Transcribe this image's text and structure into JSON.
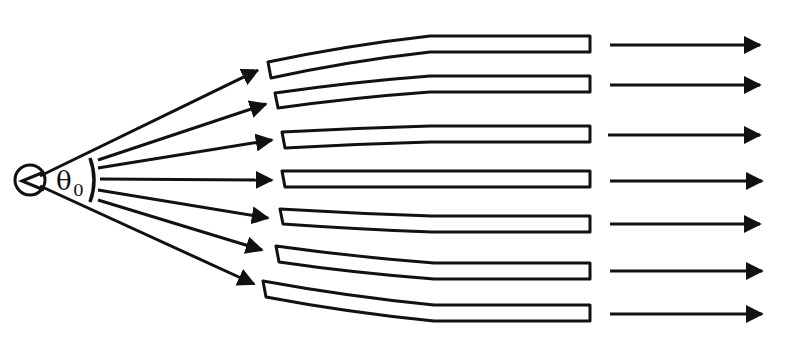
{
  "figure": {
    "type": "diagram",
    "source": {
      "label": "point-source",
      "cx": 30,
      "cy": 180,
      "r": 15
    },
    "angle_label": {
      "symbol": "θ",
      "subscript": "0",
      "text": "θ0"
    },
    "ink_color": "#111111",
    "background_color": "#ffffff",
    "fan_arrows": [
      {
        "x1": 40,
        "y1": 176,
        "x2": 258,
        "y2": 70
      },
      {
        "x1": 98,
        "y1": 160,
        "x2": 266,
        "y2": 104
      },
      {
        "x1": 98,
        "y1": 168,
        "x2": 272,
        "y2": 140
      },
      {
        "x1": 100,
        "y1": 179,
        "x2": 272,
        "y2": 180
      },
      {
        "x1": 98,
        "y1": 190,
        "x2": 268,
        "y2": 218
      },
      {
        "x1": 98,
        "y1": 200,
        "x2": 262,
        "y2": 250
      },
      {
        "x1": 40,
        "y1": 186,
        "x2": 254,
        "y2": 284
      }
    ],
    "tubes": [
      {
        "inlet_x": 268,
        "inlet_y_top": 62,
        "inlet_y_bot": 78,
        "bend_x": 430,
        "out_y_top": 36,
        "out_y_bot": 52,
        "out_x": 590
      },
      {
        "inlet_x": 275,
        "inlet_y_top": 93,
        "inlet_y_bot": 108,
        "bend_x": 430,
        "out_y_top": 76,
        "out_y_bot": 92,
        "out_x": 590
      },
      {
        "inlet_x": 282,
        "inlet_y_top": 132,
        "inlet_y_bot": 148,
        "bend_x": 430,
        "out_y_top": 126,
        "out_y_bot": 142,
        "out_x": 590
      },
      {
        "inlet_x": 282,
        "inlet_y_top": 171,
        "inlet_y_bot": 187,
        "bend_x": 430,
        "out_y_top": 171,
        "out_y_bot": 187,
        "out_x": 590
      },
      {
        "inlet_x": 280,
        "inlet_y_top": 209,
        "inlet_y_bot": 224,
        "bend_x": 432,
        "out_y_top": 216,
        "out_y_bot": 232,
        "out_x": 590
      },
      {
        "inlet_x": 276,
        "inlet_y_top": 246,
        "inlet_y_bot": 262,
        "bend_x": 434,
        "out_y_top": 263,
        "out_y_bot": 279,
        "out_x": 590
      },
      {
        "inlet_x": 263,
        "inlet_y_top": 281,
        "inlet_y_bot": 297,
        "bend_x": 434,
        "out_y_top": 305,
        "out_y_bot": 321,
        "out_x": 590
      }
    ],
    "output_arrows": [
      {
        "y": 45,
        "x1": 610,
        "x2": 760
      },
      {
        "y": 85,
        "x1": 610,
        "x2": 760
      },
      {
        "y": 135,
        "x1": 608,
        "x2": 760
      },
      {
        "y": 181,
        "x1": 610,
        "x2": 762
      },
      {
        "y": 224,
        "x1": 610,
        "x2": 760
      },
      {
        "y": 271,
        "x1": 610,
        "x2": 762
      },
      {
        "y": 314,
        "x1": 610,
        "x2": 762
      }
    ],
    "cropped_header_text": ""
  }
}
